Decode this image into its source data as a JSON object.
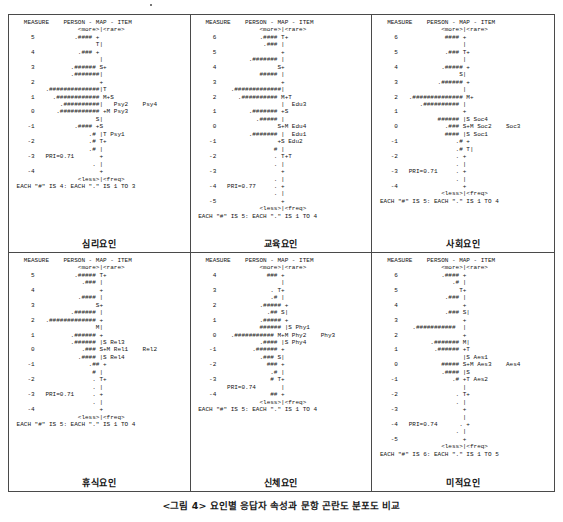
{
  "figure": {
    "caption": "<그림 4>   요인별 응답자 속성과 문항 곤란도 분포도 비교",
    "panel_count": 6
  },
  "common": {
    "header": "MEASURE    PERSON - MAP - ITEM",
    "top_labels": "<more>|<rare>",
    "bottom_labels": "<less>|<freq>",
    "measure_label": "MEASURE",
    "person_label": "PERSON",
    "item_label": "ITEM",
    "map_label": "MAP"
  },
  "panels": [
    {
      "id": "panel-psychological",
      "caption": "심리요인",
      "pri_label": "PRI=0.71",
      "pri_value": 0.71,
      "each_legend": "EACH \"#\" IS 4: EACH \".\" IS 1 TO 3",
      "hash_value": 4,
      "dot_range": "1 TO 3",
      "measure_min": -4,
      "measure_max": 5,
      "items": [
        "Psy2",
        "Psy4",
        "Psy3",
        "Psy1"
      ],
      "text": "   MEASURE    PERSON - MAP - ITEM\n                  <more>|<rare>\n     5           .#### +\n                       T|\n     4            .### +\n                        |\n     3          .###### S+\n                .#######|\n     2                  +\n         .##############|T\n     1     .############ M+S\n             .##########|   Psy2    Psy4\n     0      .########### +M Psy3\n                       S|\n    -1           .#### +S\n                     .# |T Psy1\n    -2               .# T+\n                     .# |\n    -3   PRI=0.71       +\n                      . |\n    -4                  +\n                  <less>|<freq>\n EACH \"#\" IS 4: EACH \".\" IS 1 TO 3"
    },
    {
      "id": "panel-education",
      "caption": "교육요인",
      "pri_label": "PRI=0.77",
      "pri_value": 0.77,
      "each_legend": "EACH \"#\" IS 5: EACH \".\" IS 1 TO 4",
      "hash_value": 5,
      "dot_range": "1 TO 4",
      "measure_min": -5,
      "measure_max": 6,
      "items": [
        "Edu3",
        "Edu4",
        "Edu1",
        "Edu2"
      ],
      "text": "   MEASURE    PERSON - MAP - ITEM\n                  <more>|<rare>\n     6            .#### T+\n                   .### |\n     5                  +\n               .####### |\n     4                 S+\n                  ##### |\n     3                  +\n          .#############|\n     2      .########## M+T\n                        |  Edu3\n     1         .####### +S\n                 .##### |\n     0                 S+M Edu4\n               .####### |  Edu1\n    -1                 +S Edu2\n                      # |\n    -2                . T+T\n                      . |\n    -3                  +\n                      . |\n    -4   PRI=0.77     . +\n                      . |\n    -5                  +\n                  <less>|<freq>\n EACH \"#\" IS 5: EACH \".\" IS 1 TO 4"
    },
    {
      "id": "panel-social",
      "caption": "사회요인",
      "pri_label": "PRI=0.71",
      "pri_value": 0.71,
      "each_legend": "EACH \"#\" IS 5: EACH \".\" IS 1 TO 4",
      "hash_value": 5,
      "dot_range": "1 TO 4",
      "measure_min": -4,
      "measure_max": 6,
      "items": [
        "Soc4",
        "Soc2",
        "Soc3",
        "Soc1"
      ],
      "text": "   MEASURE    PERSON - MAP - ITEM\n                  <more>|<rare>\n     6             #### +\n                        |\n     5             .### T+\n                        |\n     4            .##### +\n                       S|\n     3           .###### +\n                        |\n     2   .############## M+\n            .########## |\n     1                  +\n                 ###### |S Soc4\n     0             .### S+M Soc2    Soc3\n                   #### |S Soc1\n    -1                .# +\n                      .# T|\n    -2                . +\n                      . |\n    -3   PRI=0.71     . +\n                      . |\n    -4                  +\n                  <less>|<freq>\n EACH \"#\" IS 5: EACH \".\" IS 1 TO 4"
    },
    {
      "id": "panel-rest",
      "caption": "휴식요인",
      "pri_label": "PRI=0.71",
      "pri_value": 0.71,
      "each_legend": "EACH \"#\" IS 5: EACH \".\" IS 1 TO 4",
      "hash_value": 5,
      "dot_range": "1 TO 4",
      "measure_min": -4,
      "measure_max": 5,
      "items": [
        "Rel3",
        "Rel1",
        "Rel2",
        "Rel4"
      ],
      "text": "   MEASURE    PERSON - MAP - ITEM\n                  <more>|<rare>\n     5           .##### T+\n                   .### |\n     4                  +\n                  .#### |\n     3                 S+\n                .###### |\n     2   .############# +\n                       M|\n     1          .###### +\n                .###### |S Rel3\n     0             .### S+M Rel1    Rel2\n                  .#### |S Rel4\n    -1               .## +\n                      # |\n    -2                . T+\n                      . |\n    -3   PRI=0.71     . +\n                      . |\n    -4                  +\n                  <less>|<freq>\n EACH \"#\" IS 5: EACH \".\" IS 1 TO 4"
    },
    {
      "id": "panel-physical",
      "caption": "신체요인",
      "pri_label": "PRI=0.74",
      "pri_value": 0.74,
      "each_legend": "EACH \"#\" IS 5: EACH \".\" IS 1 TO 4",
      "hash_value": 5,
      "dot_range": "1 TO 4",
      "measure_min": -4,
      "measure_max": 4,
      "items": [
        "Phy1",
        "Phy2",
        "Phy3",
        "Phy4"
      ],
      "text": "   MEASURE    PERSON - MAP - ITEM\n                  <more>|<rare>\n     4              ### +\n                        |\n     3               . T+\n                     .# |\n     2            .##### +\n                    .## S|\n     1            .##### +\n                  ###### |S Phy1\n     0    .########### M+M Phy2    Phy3\n                  .#### |S Phy4\n    -1          .###### +\n                  .### S|\n    -2              ### +\n                     .# |\n    -3               # T+\n         PRI=0.74       |\n    -4               ## +\n                  <less>|<freq>\n EACH \"#\" IS 5: EACH \".\" IS 1 TO 4"
    },
    {
      "id": "panel-aesthetic",
      "caption": "미적요인",
      "pri_label": "PRI=0.74",
      "pri_value": 0.74,
      "each_legend": "EACH \"#\" IS 6: EACH \".\" IS 1 TO 5",
      "hash_value": 6,
      "dot_range": "1 TO 5",
      "measure_min": -5,
      "measure_max": 6,
      "items": [
        "Aes1",
        "Aes3",
        "Aes4",
        "Aes2"
      ],
      "text": "   MEASURE    PERSON - MAP - ITEM\n                  <more>|<rare>\n     6            .#### +\n                     .# |\n     5                 T+\n                   .### |\n     4                  +\n                   .### S|\n     3                  +\n          .###########  |\n     2                  +\n               .####### M|\n     1          .###### +T\n                        |S Aes1\n     0            ##### S+M Aes3    Aes4\n                  .#### |S\n    -1               .# +T Aes2\n                        |\n    -2                . T+\n                      . |\n    -3                  +\n                        |\n    -4   PRI=0.74      . +\n                      . |\n    -5                  +\n                  <less>|<freq>\n EACH \"#\" IS 6: EACH \".\" IS 1 TO 5"
    }
  ]
}
